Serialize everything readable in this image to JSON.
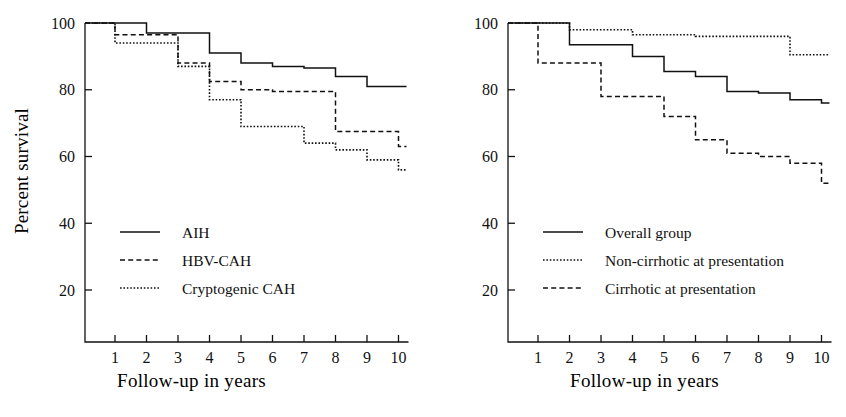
{
  "figure": {
    "panels": [
      {
        "id": "panel-left",
        "ylabel": "Percent survival",
        "xlabel": "Follow-up in years",
        "chart_data": {
          "type": "line",
          "title": "",
          "xlabel": "Follow-up in years",
          "ylabel": "Percent survival",
          "xlim": [
            0,
            10
          ],
          "ylim": [
            0,
            100
          ],
          "xticks": [
            1,
            2,
            3,
            4,
            5,
            6,
            7,
            8,
            9,
            10
          ],
          "yticks": [
            20,
            40,
            60,
            80,
            100
          ],
          "grid": false,
          "legend_position": "lower-left-inside",
          "step": "post",
          "series": [
            {
              "name": "AIH",
              "style": "solid",
              "x": [
                0,
                1,
                2,
                3,
                4,
                5,
                6,
                7,
                8,
                9,
                10
              ],
              "values": [
                100,
                100,
                97,
                97,
                91,
                88,
                87,
                86.5,
                84,
                81,
                81
              ]
            },
            {
              "name": "HBV-CAH",
              "style": "dashed",
              "x": [
                0,
                1,
                2,
                3,
                4,
                5,
                6,
                7,
                8,
                9,
                10
              ],
              "values": [
                100,
                96.5,
                96.5,
                88,
                82.5,
                80,
                79.5,
                79.5,
                67.5,
                67.5,
                63
              ]
            },
            {
              "name": "Cryptogenic CAH",
              "style": "dotted",
              "x": [
                0,
                1,
                2,
                3,
                4,
                5,
                6,
                7,
                8,
                9,
                10
              ],
              "values": [
                100,
                94,
                94,
                87,
                77,
                69,
                69,
                64,
                62,
                59,
                56
              ]
            }
          ]
        },
        "legend": [
          {
            "label": "AIH",
            "style": "solid"
          },
          {
            "label": "HBV-CAH",
            "style": "dashed"
          },
          {
            "label": "Cryptogenic CAH",
            "style": "dotted"
          }
        ]
      },
      {
        "id": "panel-right",
        "ylabel": "",
        "xlabel": "Follow-up in years",
        "chart_data": {
          "type": "line",
          "title": "",
          "xlabel": "Follow-up in years",
          "ylabel": "Percent survival",
          "xlim": [
            0,
            10
          ],
          "ylim": [
            0,
            100
          ],
          "xticks": [
            1,
            2,
            3,
            4,
            5,
            6,
            7,
            8,
            9,
            10
          ],
          "yticks": [
            20,
            40,
            60,
            80,
            100
          ],
          "grid": false,
          "legend_position": "lower-left-inside",
          "step": "post",
          "series": [
            {
              "name": "Overall group",
              "style": "solid",
              "x": [
                0,
                1,
                2,
                3,
                4,
                5,
                6,
                7,
                8,
                9,
                10
              ],
              "values": [
                100,
                100,
                93.5,
                93.5,
                90,
                85.5,
                84,
                79.5,
                79,
                77,
                76
              ]
            },
            {
              "name": "Non-cirrhotic at presentation",
              "style": "dotted",
              "x": [
                0,
                1,
                2,
                3,
                4,
                5,
                6,
                7,
                8,
                9,
                10
              ],
              "values": [
                100,
                100,
                98,
                98,
                96.5,
                96.5,
                96,
                96,
                96,
                90.5,
                90.5
              ]
            },
            {
              "name": "Cirrhotic at presentation",
              "style": "dashed",
              "x": [
                0,
                1,
                2,
                3,
                4,
                5,
                6,
                7,
                8,
                9,
                10
              ],
              "values": [
                100,
                88,
                88,
                78,
                78,
                72,
                65,
                61,
                60,
                58,
                52
              ]
            }
          ]
        },
        "legend": [
          {
            "label": "Overall group",
            "style": "solid"
          },
          {
            "label": "Non-cirrhotic at presentation",
            "style": "dotted"
          },
          {
            "label": "Cirrhotic at presentation",
            "style": "dashed"
          }
        ]
      }
    ]
  }
}
